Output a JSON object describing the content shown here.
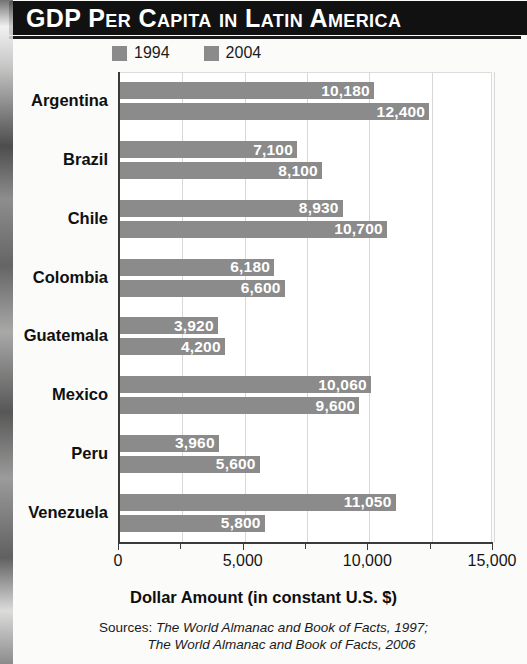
{
  "title": "GDP Per Capita in Latin America",
  "legend": {
    "position": "top-left",
    "items": [
      {
        "label": "1994",
        "color": "#8b8b8b"
      },
      {
        "label": "2004",
        "color": "#8b8b8b"
      }
    ]
  },
  "axis": {
    "x_title": "Dollar Amount (in constant U.S. $)",
    "tick_labels": [
      "0",
      "5,000",
      "10,000",
      "15,000"
    ],
    "tick_values": [
      0,
      5000,
      10000,
      15000
    ],
    "minor_ticks": [
      2500,
      7500,
      12500
    ]
  },
  "sources": {
    "label": "Sources:",
    "line1": "The World Almanac and Book of Facts, 1997;",
    "line2": "The World Almanac and Book of Facts, 2006"
  },
  "colors": {
    "bar": "#8b8b8b",
    "banner": "#111111",
    "banner_text": "#ffffff",
    "grid": "#d8d8d8",
    "axis": "#3a3a3a",
    "value_label": "#ffffff"
  },
  "chart_data": {
    "type": "bar",
    "orientation": "horizontal",
    "title": "GDP Per Capita in Latin America",
    "xlabel": "Dollar Amount (in constant U.S. $)",
    "ylabel": "",
    "xlim": [
      0,
      15000
    ],
    "xticks": [
      0,
      2500,
      5000,
      7500,
      10000,
      12500,
      15000
    ],
    "xticklabels": [
      "0",
      "",
      "5,000",
      "",
      "10,000",
      "",
      "15,000"
    ],
    "grid": true,
    "legend_position": "top-left",
    "categories": [
      "Argentina",
      "Brazil",
      "Chile",
      "Colombia",
      "Guatemala",
      "Mexico",
      "Peru",
      "Venezuela"
    ],
    "series": [
      {
        "name": "1994",
        "color": "#8b8b8b",
        "values": [
          10180,
          7100,
          8930,
          6180,
          3920,
          10060,
          3960,
          11050
        ],
        "labels": [
          "10,180",
          "7,100",
          "8,930",
          "6,180",
          "3,920",
          "10,060",
          "3,960",
          "11,050"
        ]
      },
      {
        "name": "2004",
        "color": "#8b8b8b",
        "values": [
          12400,
          8100,
          10700,
          6600,
          4200,
          9600,
          5600,
          5800
        ],
        "labels": [
          "12,400",
          "8,100",
          "10,700",
          "6,600",
          "4,200",
          "9,600",
          "5,600",
          "5,800"
        ]
      }
    ]
  }
}
